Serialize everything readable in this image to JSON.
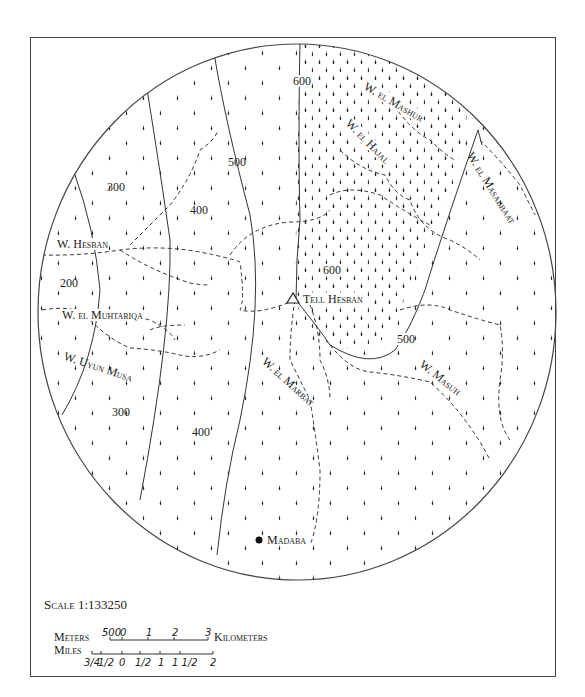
{
  "map": {
    "elevations": [
      {
        "id": "e300a",
        "label": "300",
        "x": 107,
        "y": 187
      },
      {
        "id": "e200",
        "label": "200",
        "x": 60,
        "y": 283
      },
      {
        "id": "e400a",
        "label": "400",
        "x": 190,
        "y": 210
      },
      {
        "id": "e500a",
        "label": "500",
        "x": 228,
        "y": 162
      },
      {
        "id": "e600a",
        "label": "600",
        "x": 293,
        "y": 79
      },
      {
        "id": "e600b",
        "label": "600",
        "x": 323,
        "y": 268
      },
      {
        "id": "e500b",
        "label": "500",
        "x": 397,
        "y": 337
      },
      {
        "id": "e300b",
        "label": "300",
        "x": 112,
        "y": 412
      },
      {
        "id": "e400b",
        "label": "400",
        "x": 192,
        "y": 432
      }
    ],
    "wadis": [
      {
        "id": "w-hesban",
        "label": "W. Hesban",
        "x": 57,
        "y": 237,
        "rotate": 0
      },
      {
        "id": "w-muhtariqa",
        "label": "W. el Muhtariqa",
        "x": 62,
        "y": 309,
        "rotate": 0
      },
      {
        "id": "w-uyun-musa",
        "label": "W. Uyun Musa",
        "x": 68,
        "y": 355,
        "rotate": 18
      },
      {
        "id": "w-marbat",
        "label": "W. el Marbat",
        "x": 263,
        "y": 368,
        "rotate": 40
      },
      {
        "id": "w-masuh",
        "label": "W. Masuh",
        "x": 420,
        "y": 370,
        "rotate": 38
      },
      {
        "id": "w-mashur",
        "label": "W. el Mashur",
        "x": 366,
        "y": 92,
        "rotate": 30
      },
      {
        "id": "w-hajal",
        "label": "W. el Hajal",
        "x": 350,
        "y": 126,
        "rotate": 45
      },
      {
        "id": "w-masabbaat",
        "label": "W. el Masabbaat",
        "x": 469,
        "y": 154,
        "rotate": 58
      }
    ],
    "sites": [
      {
        "id": "tell-hesban",
        "label": "Tell Hesban",
        "symbol": "triangle",
        "x": 293,
        "y": 299
      },
      {
        "id": "madaba",
        "label": "Madaba",
        "symbol": "dot",
        "x": 259,
        "y": 540
      }
    ]
  },
  "scale": {
    "ratio_label": "Scale 1:133250",
    "meters_label": "Meters",
    "kilometers_label": "Kilometers",
    "miles_label": "Miles",
    "km_ticks": [
      "500",
      "0",
      "1",
      "2",
      "3"
    ],
    "mile_ticks": [
      "3/4",
      "1/2",
      "0",
      "1/2",
      "1",
      "1 1/2",
      "2"
    ]
  }
}
